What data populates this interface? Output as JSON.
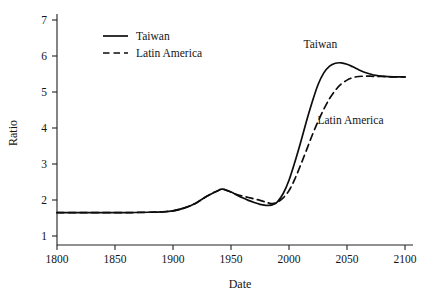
{
  "chart_data": {
    "type": "line",
    "title": "",
    "xlabel": "Date",
    "ylabel": "Ratio",
    "xlim": [
      1800,
      2100
    ],
    "ylim": [
      1,
      7
    ],
    "xticks": [
      1800,
      1850,
      1900,
      1950,
      2000,
      2050,
      2100
    ],
    "xtick_labels": [
      "1800",
      "1850",
      "1900",
      "1950",
      "2000",
      "2050",
      "2100"
    ],
    "yticks": [
      1,
      2,
      3,
      4,
      5,
      6,
      7
    ],
    "ytick_labels": [
      "1",
      "2",
      "3",
      "4",
      "5",
      "6",
      "7"
    ],
    "grid": false,
    "legend_position": "upper-left",
    "series": [
      {
        "name": "Taiwan",
        "style": "solid",
        "color": "#0d0d0d",
        "x": [
          1800,
          1820,
          1840,
          1860,
          1880,
          1890,
          1900,
          1910,
          1920,
          1930,
          1940,
          1943,
          1950,
          1955,
          1960,
          1965,
          1970,
          1975,
          1980,
          1982,
          1986,
          1990,
          1995,
          2000,
          2005,
          2010,
          2015,
          2020,
          2025,
          2030,
          2035,
          2040,
          2045,
          2050,
          2055,
          2060,
          2065,
          2070,
          2075,
          2080,
          2090,
          2100
        ],
        "y": [
          1.65,
          1.65,
          1.65,
          1.65,
          1.66,
          1.67,
          1.7,
          1.78,
          1.92,
          2.12,
          2.28,
          2.3,
          2.22,
          2.14,
          2.06,
          1.99,
          1.93,
          1.88,
          1.85,
          1.85,
          1.87,
          1.95,
          2.18,
          2.55,
          3.05,
          3.6,
          4.18,
          4.72,
          5.2,
          5.53,
          5.72,
          5.8,
          5.81,
          5.77,
          5.7,
          5.62,
          5.55,
          5.5,
          5.46,
          5.44,
          5.42,
          5.42
        ]
      },
      {
        "name": "Latin America",
        "style": "dashed",
        "color": "#0d0d0d",
        "x": [
          1800,
          1820,
          1840,
          1860,
          1880,
          1890,
          1900,
          1910,
          1920,
          1930,
          1940,
          1943,
          1950,
          1955,
          1960,
          1965,
          1970,
          1975,
          1980,
          1982,
          1986,
          1990,
          1995,
          2000,
          2005,
          2010,
          2015,
          2020,
          2025,
          2030,
          2035,
          2040,
          2045,
          2050,
          2055,
          2060,
          2065,
          2070,
          2075,
          2080,
          2090,
          2100
        ],
        "y": [
          1.65,
          1.65,
          1.65,
          1.65,
          1.66,
          1.67,
          1.7,
          1.78,
          1.92,
          2.12,
          2.28,
          2.3,
          2.22,
          2.15,
          2.11,
          2.07,
          2.03,
          1.99,
          1.94,
          1.92,
          1.9,
          1.94,
          2.06,
          2.26,
          2.58,
          2.97,
          3.38,
          3.8,
          4.18,
          4.52,
          4.82,
          5.05,
          5.22,
          5.33,
          5.4,
          5.43,
          5.44,
          5.44,
          5.43,
          5.43,
          5.42,
          5.42
        ]
      }
    ],
    "annotations": [
      {
        "text": "Taiwan",
        "x": 2027,
        "y": 6.22
      },
      {
        "text": "Latin America",
        "x": 2053,
        "y": 4.1
      }
    ]
  },
  "legend": {
    "entries": [
      {
        "label": "Taiwan",
        "style": "solid"
      },
      {
        "label": "Latin America",
        "style": "dashed"
      }
    ]
  },
  "axes": {
    "x_title": "Date",
    "y_title": "Ratio"
  }
}
